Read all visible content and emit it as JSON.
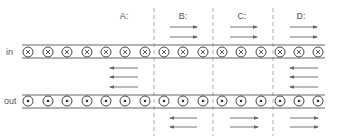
{
  "diagram": {
    "rows": [
      {
        "label": "in",
        "symbol": "cross",
        "meaning": "current into page",
        "y": 52,
        "rail_top": 45,
        "rail_bottom": 58,
        "label_x": 6
      },
      {
        "label": "out",
        "symbol": "dot",
        "meaning": "current out of page",
        "y": 101,
        "rail_top": 95,
        "rail_bottom": 108,
        "label_x": 4
      }
    ],
    "conductor_x": [
      28,
      48,
      67,
      87,
      106,
      125,
      145,
      164,
      183,
      203,
      222,
      241,
      261,
      280,
      299,
      318
    ],
    "conductor_radius": 5,
    "rail_x": [
      22,
      325
    ],
    "dividers_x": [
      154,
      213,
      273
    ],
    "regions": [
      {
        "label": "A:",
        "x": 124
      },
      {
        "label": "B:",
        "x": 183
      },
      {
        "label": "C:",
        "x": 242
      },
      {
        "label": "D:",
        "x": 301
      }
    ],
    "region_label_y": 19,
    "arrows": [
      {
        "region": "B",
        "dir": "right",
        "x1": 170,
        "x2": 197,
        "y": 27
      },
      {
        "region": "B",
        "dir": "right",
        "x1": 170,
        "x2": 197,
        "y": 37
      },
      {
        "region": "C",
        "dir": "right",
        "x1": 230,
        "x2": 257,
        "y": 27
      },
      {
        "region": "C",
        "dir": "right",
        "x1": 230,
        "x2": 257,
        "y": 37
      },
      {
        "region": "D",
        "dir": "right",
        "x1": 290,
        "x2": 317,
        "y": 27
      },
      {
        "region": "D",
        "dir": "right",
        "x1": 290,
        "x2": 317,
        "y": 37
      },
      {
        "region": "A",
        "dir": "left",
        "x1": 110,
        "x2": 138,
        "y": 68
      },
      {
        "region": "A",
        "dir": "left",
        "x1": 110,
        "x2": 138,
        "y": 77
      },
      {
        "region": "A",
        "dir": "left",
        "x1": 110,
        "x2": 138,
        "y": 87
      },
      {
        "region": "D",
        "dir": "left",
        "x1": 290,
        "x2": 318,
        "y": 68
      },
      {
        "region": "D",
        "dir": "left",
        "x1": 290,
        "x2": 318,
        "y": 77
      },
      {
        "region": "D",
        "dir": "left",
        "x1": 290,
        "x2": 318,
        "y": 87
      },
      {
        "region": "B",
        "dir": "left",
        "x1": 170,
        "x2": 197,
        "y": 118
      },
      {
        "region": "B",
        "dir": "left",
        "x1": 170,
        "x2": 197,
        "y": 127
      },
      {
        "region": "C",
        "dir": "right",
        "x1": 230,
        "x2": 258,
        "y": 118
      },
      {
        "region": "C",
        "dir": "right",
        "x1": 230,
        "x2": 258,
        "y": 127
      },
      {
        "region": "D",
        "dir": "right",
        "x1": 290,
        "x2": 318,
        "y": 118
      },
      {
        "region": "D",
        "dir": "right",
        "x1": 290,
        "x2": 318,
        "y": 127
      }
    ]
  }
}
